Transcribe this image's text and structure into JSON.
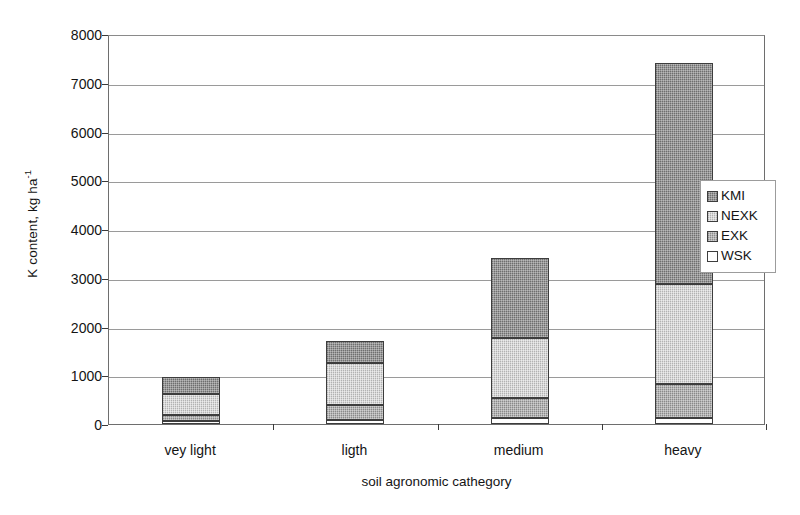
{
  "chart_data": {
    "type": "bar",
    "stacked": true,
    "title": "",
    "xlabel": "soil agronomic cathegory",
    "ylabel": "K content, kg ha-1",
    "ylabel_base": "K content, kg ha",
    "ylabel_exponent": "-1",
    "categories": [
      "vey light",
      "ligth",
      "medium",
      "heavy"
    ],
    "ylim": [
      0,
      8000
    ],
    "ytick_labels": [
      "8000",
      "7000",
      "6000",
      "5000",
      "4000",
      "3000",
      "2000",
      "1000",
      "0"
    ],
    "yticks": [
      8000,
      7000,
      6000,
      5000,
      4000,
      3000,
      2000,
      1000,
      0
    ],
    "grid": "horizontal",
    "legend_position": "right",
    "series": [
      {
        "name": "WSK",
        "color": "#ffffff",
        "values": [
          60,
          90,
          120,
          120
        ]
      },
      {
        "name": "EXK",
        "color": "#a6a6a6",
        "values": [
          120,
          300,
          420,
          700
        ]
      },
      {
        "name": "NEXK",
        "color": "#cfcfcf",
        "values": [
          440,
          860,
          1220,
          2050
        ]
      },
      {
        "name": "KMI",
        "color": "#8a8a8a",
        "values": [
          350,
          450,
          1640,
          4530
        ]
      }
    ],
    "stack_order_bottom_to_top": [
      "WSK",
      "EXK",
      "NEXK",
      "KMI"
    ],
    "totals": [
      970,
      1700,
      3400,
      7400
    ]
  },
  "legend": {
    "entries": [
      {
        "label": "KMI",
        "color": "#8a8a8a"
      },
      {
        "label": "NEXK",
        "color": "#cfcfcf"
      },
      {
        "label": "EXK",
        "color": "#a6a6a6"
      },
      {
        "label": "WSK",
        "color": "#ffffff"
      }
    ]
  }
}
